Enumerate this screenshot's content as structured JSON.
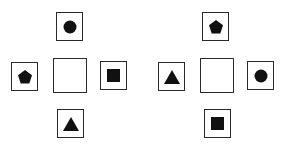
{
  "figure": {
    "type": "puzzle-diagram",
    "fill_color": "#111111",
    "border_color": "#2a2a2a",
    "groups": [
      {
        "id": "left-cross",
        "top": {
          "shape": "circle"
        },
        "left": {
          "shape": "pentagon"
        },
        "center": {
          "shape": "empty"
        },
        "right": {
          "shape": "square"
        },
        "bottom": {
          "shape": "triangle"
        }
      },
      {
        "id": "right-cross",
        "top": {
          "shape": "pentagon"
        },
        "left": {
          "shape": "triangle"
        },
        "center": {
          "shape": "empty"
        },
        "right": {
          "shape": "circle"
        },
        "bottom": {
          "shape": "square"
        }
      }
    ]
  }
}
